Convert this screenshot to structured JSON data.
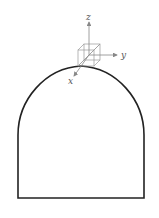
{
  "diagram": {
    "type": "tunnel-cross-section",
    "shape": "horseshoe arch with vertical walls and flat floor",
    "axes": {
      "x_label": "x",
      "y_label": "y",
      "z_label": "z"
    },
    "colors": {
      "outline": "#222222",
      "axes": "#888888",
      "cube": "#999999"
    }
  }
}
